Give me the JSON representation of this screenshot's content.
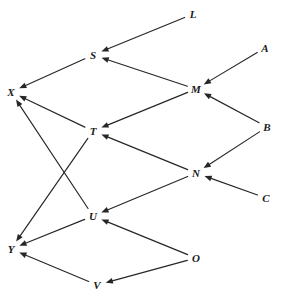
{
  "diagram": {
    "type": "directed-graph",
    "title": "",
    "width": 286,
    "height": 302,
    "background_color": "#ffffff",
    "edge_color": "#262626",
    "label_color": "#1a1a1a",
    "nodes": [
      {
        "id": "L",
        "label": "L",
        "x": 193,
        "y": 14
      },
      {
        "id": "A",
        "label": "A",
        "x": 265,
        "y": 48
      },
      {
        "id": "S",
        "label": "S",
        "x": 93,
        "y": 55
      },
      {
        "id": "M",
        "label": "M",
        "x": 196,
        "y": 89
      },
      {
        "id": "X",
        "label": "X",
        "x": 11,
        "y": 92
      },
      {
        "id": "B",
        "label": "B",
        "x": 267,
        "y": 127
      },
      {
        "id": "T",
        "label": "T",
        "x": 93,
        "y": 131
      },
      {
        "id": "N",
        "label": "N",
        "x": 196,
        "y": 173
      },
      {
        "id": "C",
        "label": "C",
        "x": 266,
        "y": 198
      },
      {
        "id": "U",
        "label": "U",
        "x": 93,
        "y": 216
      },
      {
        "id": "Y",
        "label": "Y",
        "x": 11,
        "y": 249
      },
      {
        "id": "O",
        "label": "O",
        "x": 196,
        "y": 258
      },
      {
        "id": "V",
        "label": "V",
        "x": 97,
        "y": 285
      }
    ],
    "edges": [
      {
        "from": "L",
        "to": "S",
        "directed": true
      },
      {
        "from": "M",
        "to": "S",
        "directed": true
      },
      {
        "from": "S",
        "to": "X",
        "directed": true
      },
      {
        "from": "A",
        "to": "M",
        "directed": true
      },
      {
        "from": "B",
        "to": "M",
        "directed": true
      },
      {
        "from": "M",
        "to": "T",
        "directed": true
      },
      {
        "from": "T",
        "to": "X",
        "directed": true
      },
      {
        "from": "B",
        "to": "N",
        "directed": true
      },
      {
        "from": "C",
        "to": "N",
        "directed": true
      },
      {
        "from": "N",
        "to": "T",
        "directed": true
      },
      {
        "from": "N",
        "to": "U",
        "directed": true
      },
      {
        "from": "U",
        "to": "X",
        "directed": true
      },
      {
        "from": "T",
        "to": "Y",
        "directed": true
      },
      {
        "from": "U",
        "to": "Y",
        "directed": true
      },
      {
        "from": "O",
        "to": "U",
        "directed": true
      },
      {
        "from": "O",
        "to": "V",
        "directed": true
      },
      {
        "from": "V",
        "to": "Y",
        "directed": true
      }
    ]
  }
}
